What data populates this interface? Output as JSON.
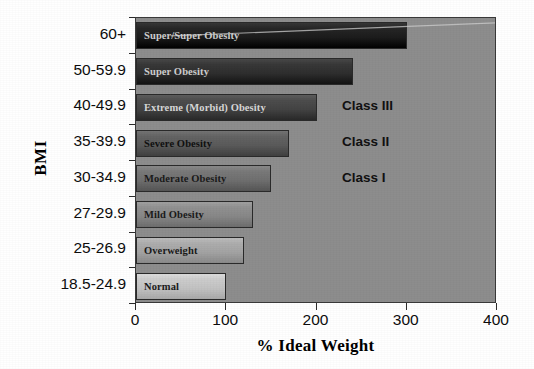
{
  "chart_data": {
    "type": "bar",
    "orientation": "horizontal",
    "title": "",
    "xlabel": "% Ideal Weight",
    "ylabel": "BMI",
    "xlim": [
      0,
      400
    ],
    "xticks": [
      "0",
      "100",
      "200",
      "300",
      "400"
    ],
    "grid": false,
    "legend": "none",
    "categories": [
      "60+",
      "50-59.9",
      "40-49.9",
      "35-39.9",
      "30-34.9",
      "27-29.9",
      "25-26.9",
      "18.5-24.9"
    ],
    "values": [
      300,
      240,
      200,
      170,
      150,
      130,
      120,
      100
    ],
    "bar_labels": [
      "Super/Super Obesity",
      "Super Obesity",
      "Extreme (Morbid) Obesity",
      "Severe Obesity",
      "Moderate Obesity",
      "Mild Obesity",
      "Overweight",
      "Normal"
    ],
    "bar_colors": [
      "#1c1c1c",
      "#2e2e2e",
      "#434343",
      "#5a5a5a",
      "#6f6f6f",
      "#878787",
      "#a3a3a3",
      "#c2c2c2"
    ],
    "annotations": [
      {
        "text": "Class III",
        "category": "40-49.9"
      },
      {
        "text": "Class II",
        "category": "35-39.9"
      },
      {
        "text": "Class I",
        "category": "30-34.9"
      }
    ],
    "plot_background": "#8d8d8d",
    "axis_color": "#2b2b2b"
  }
}
